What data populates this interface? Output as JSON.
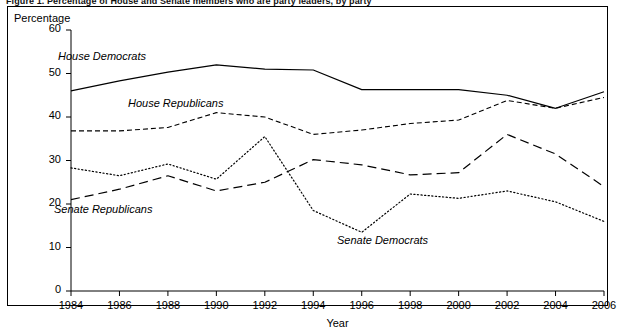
{
  "figure": {
    "title": "Figure 1.  Percentage of House and Senate members who are party leaders, by party",
    "y_axis_title": "Percentage",
    "x_axis_title": "Year"
  },
  "axes": {
    "y_ticks": [
      "0",
      "10",
      "20",
      "30",
      "40",
      "50",
      "60"
    ],
    "x_ticks": [
      "1984",
      "1986",
      "1988",
      "1990",
      "1992",
      "1994",
      "1996",
      "1998",
      "2000",
      "2002",
      "2004",
      "2006"
    ]
  },
  "annotations": {
    "house_democrats": "House Democrats",
    "house_republicans": "House Republicans",
    "senate_republicans": "Senate Republicans",
    "senate_democrats": "Senate Democrats"
  },
  "chart_data": {
    "type": "line",
    "title": "Figure 1.  Percentage of House and Senate members who are party leaders, by party",
    "xlabel": "Year",
    "ylabel": "Percentage",
    "xlim": [
      1984,
      2006
    ],
    "ylim": [
      0,
      60
    ],
    "grid": false,
    "legend": "inline-annotations",
    "x": [
      1984,
      1986,
      1988,
      1990,
      1992,
      1994,
      1996,
      1998,
      2000,
      2002,
      2004,
      2006
    ],
    "series": [
      {
        "name": "House Democrats",
        "style": "solid",
        "color": "#000000",
        "values": [
          46.0,
          48.3,
          50.3,
          52.0,
          51.0,
          50.8,
          46.3,
          46.3,
          46.3,
          45.0,
          42.0,
          45.8
        ]
      },
      {
        "name": "House Republicans",
        "style": "dashed",
        "color": "#000000",
        "values": [
          36.8,
          36.8,
          37.6,
          41.0,
          40.0,
          36.0,
          37.0,
          38.5,
          39.3,
          43.8,
          42.0,
          44.5
        ]
      },
      {
        "name": "Senate Republicans",
        "style": "long-dash",
        "color": "#000000",
        "values": [
          21.0,
          23.4,
          26.5,
          23.0,
          25.0,
          30.2,
          29.0,
          26.7,
          27.2,
          36.0,
          31.5,
          24.0
        ]
      },
      {
        "name": "Senate Democrats",
        "style": "dotted",
        "color": "#000000",
        "values": [
          28.3,
          26.5,
          29.2,
          25.7,
          35.5,
          18.5,
          13.5,
          22.3,
          21.3,
          23.0,
          20.5,
          16.0
        ]
      }
    ]
  }
}
